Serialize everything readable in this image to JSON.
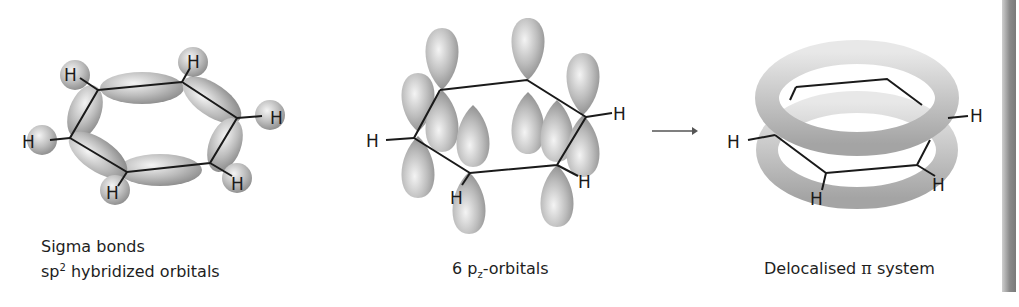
{
  "figure": {
    "panels": [
      {
        "id": "sigma",
        "caption_line1": "Sigma bonds",
        "caption_line2_prefix": "sp",
        "caption_line2_sup": "2",
        "caption_line2_suffix": " hybridized orbitals",
        "atom_labels": [
          "H",
          "H",
          "H",
          "H",
          "H",
          "H"
        ]
      },
      {
        "id": "p-orbitals",
        "caption_prefix": "6 p",
        "caption_sub": "z",
        "caption_suffix": "-orbitals",
        "atom_labels": [
          "H",
          "H",
          "H",
          "H"
        ]
      },
      {
        "id": "delocalised",
        "caption_prefix": "Delocalised ",
        "caption_symbol": "π",
        "caption_suffix": " system",
        "atom_labels": [
          "H",
          "H",
          "H",
          "H"
        ]
      }
    ],
    "arrow": "→",
    "colors": {
      "orbital_light": "#f2f2f2",
      "orbital_dark": "#8c8c8c",
      "bond": "#1a1a1a"
    }
  }
}
